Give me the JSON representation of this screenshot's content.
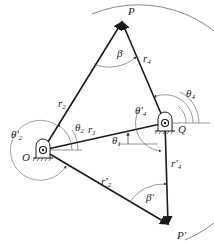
{
  "diagram": {
    "type": "four-bar linkage two-position synthesis",
    "colors": {
      "link": "#1a1a1a",
      "arc": "#555555",
      "background": "#ffffff"
    },
    "points": {
      "O": {
        "label": "O",
        "x": 43,
        "y": 150
      },
      "Q": {
        "label": "Q",
        "x": 165,
        "y": 123
      },
      "P": {
        "label": "P",
        "x": 122,
        "y": 22
      },
      "P_prime": {
        "label": "P'",
        "x": 168,
        "y": 224
      }
    },
    "labels": {
      "P": "P",
      "P_prime": "P'",
      "O": "O",
      "Q": "Q",
      "beta": "β",
      "beta_prime": "β'",
      "r1": "r",
      "r1_sub": "1",
      "r2": "r",
      "r2_sub": "2",
      "r2p": "r'",
      "r2p_sub": "2",
      "r4": "r",
      "r4_sub": "4",
      "r4p": "r'",
      "r4p_sub": "4",
      "theta1": "θ",
      "theta1_sub": "1",
      "theta2": "θ",
      "theta2_sub": "2",
      "theta2p": "θ'",
      "theta2p_sub": "2",
      "theta4": "θ",
      "theta4_sub": "4",
      "theta4p": "θ'",
      "theta4p_sub": "4"
    }
  }
}
